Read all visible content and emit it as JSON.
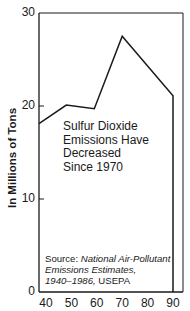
{
  "chart_data": {
    "type": "line",
    "title": "",
    "xlabel": "",
    "ylabel": "In Millions of Tons",
    "x": [
      40,
      48,
      59,
      70,
      90,
      90
    ],
    "values": [
      18.1,
      20.1,
      19.7,
      27.5,
      21.1,
      0
    ],
    "series": [
      {
        "name": "Sulfur Dioxide Emissions",
        "x": [
          40,
          48,
          59,
          70,
          90,
          90
        ],
        "values": [
          18.1,
          20.1,
          19.7,
          27.5,
          21.1,
          0
        ]
      }
    ],
    "xlim": [
      40,
      94
    ],
    "ylim": [
      0,
      30
    ],
    "xticks": [
      "40",
      "50",
      "60",
      "70",
      "80",
      "90"
    ],
    "yticks": [
      "0",
      "10",
      "20",
      "30"
    ],
    "grid": false,
    "legend": null,
    "annotation": [
      "Sulfur Dioxide",
      "Emissions Have",
      "Decreased",
      "Since 1970"
    ],
    "source": {
      "prefix": "Source: ",
      "line1_italic": "National Air-Pollutant",
      "line2_italic": "Emissions Estimates,",
      "line3_italic": "1940–1986,",
      "line3_regular": " USEPA"
    }
  },
  "colors": {
    "line": "#1a1a1a",
    "frame": "#1a1a1a",
    "background": "#ffffff"
  }
}
